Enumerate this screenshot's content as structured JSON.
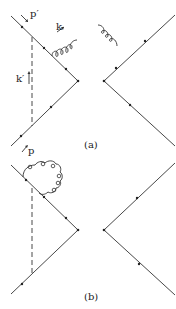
{
  "diagrams": [
    {
      "caption": "(a)",
      "labels": {
        "p_prime": "p′",
        "k": "k",
        "k_prime": "k′",
        "p": "p"
      }
    },
    {
      "caption": "(b)"
    }
  ],
  "colors": {
    "line": "#333333",
    "background": "#ffffff"
  }
}
